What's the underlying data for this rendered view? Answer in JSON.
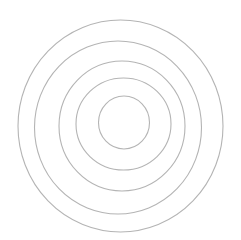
{
  "diagram": {
    "type": "concentric-circles",
    "background": "#ffffff",
    "stroke_color": "#b4b4b4",
    "circles": [
      {
        "cx": 120.5,
        "cy": 126,
        "rx": 102.5,
        "ry": 106
      },
      {
        "cx": 118,
        "cy": 127.5,
        "rx": 83.5,
        "ry": 86.5
      },
      {
        "cx": 122,
        "cy": 126,
        "rx": 63,
        "ry": 65
      },
      {
        "cx": 123.5,
        "cy": 124,
        "rx": 47.5,
        "ry": 46
      },
      {
        "cx": 124,
        "cy": 122.5,
        "rx": 25.5,
        "ry": 26.5
      }
    ]
  }
}
